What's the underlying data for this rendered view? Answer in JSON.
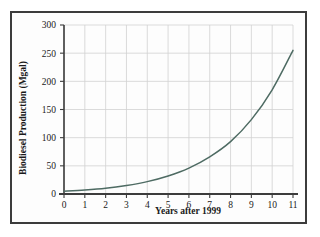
{
  "chart_data": {
    "type": "line",
    "title": "",
    "xlabel": "Years after 1999",
    "ylabel": "Biodiesel Production (Mgal)",
    "xlim": [
      0,
      11
    ],
    "ylim": [
      0,
      300
    ],
    "xticks": [
      0,
      1,
      2,
      3,
      4,
      5,
      6,
      7,
      8,
      9,
      10,
      11
    ],
    "yticks": [
      0,
      50,
      100,
      150,
      200,
      250,
      300
    ],
    "xtick_labels": [
      "0",
      "1",
      "2",
      "3",
      "4",
      "5",
      "6",
      "7",
      "8",
      "9",
      "10",
      "11"
    ],
    "ytick_labels": [
      "0",
      "50",
      "100",
      "150",
      "200",
      "250",
      "300"
    ],
    "grid": true,
    "legend": "none",
    "series": [
      {
        "name": "Biodiesel Production",
        "color": "#4e6b63",
        "x": [
          0,
          1,
          2,
          3,
          4,
          5,
          6,
          7,
          8,
          9,
          10,
          11
        ],
        "values": [
          5,
          7,
          10,
          15,
          22,
          32,
          46,
          66,
          93,
          132,
          185,
          255
        ]
      }
    ]
  },
  "axes": {
    "y_title": "Biodiesel Production (Mgal)",
    "x_title": "Years after 1999"
  },
  "colors": {
    "curve": "#4e6b63",
    "grid": "#d2d2d2",
    "axis": "#3c3c3c",
    "border": "#3c3c3c",
    "background": "#fdfdfd"
  }
}
